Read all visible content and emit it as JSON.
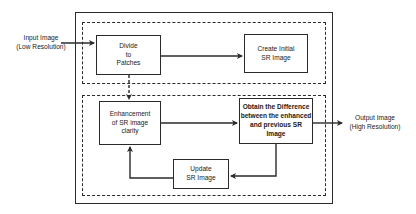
{
  "diagram": {
    "input": {
      "line1": "Input Image",
      "line2": "(Low Resolution)"
    },
    "output": {
      "line1": "Output Image",
      "line2": "(High Resolution)"
    },
    "nodes": {
      "divide": "Divide\nto\nPatches",
      "create": "Create Initial\nSR Image",
      "enhance": "Enhancement\nof SR image\nclarity",
      "difference": "Obtain the Difference\nbetween the enhanced\nand previous SR Image",
      "update": "Update\nSR Image"
    },
    "colors": {
      "line": "#2a2a2a",
      "background": "#ffffff"
    }
  }
}
